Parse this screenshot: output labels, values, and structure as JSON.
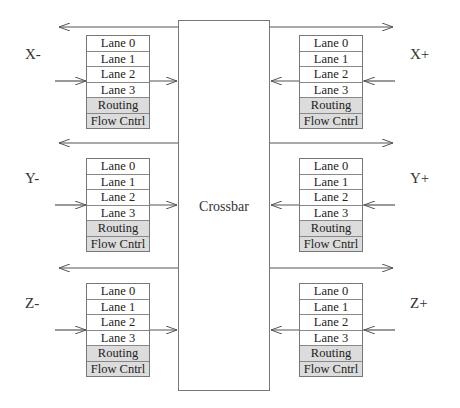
{
  "diagram": {
    "crossbar_label": "Crossbar",
    "colors": {
      "line": "#555555",
      "box_border": "#777777",
      "shaded_row": "#dcdcdc",
      "background": "#ffffff"
    },
    "ports": [
      {
        "id": "x-minus",
        "label": "X-",
        "side": "left",
        "rows": [
          "Lane 0",
          "Lane 1",
          "Lane 2",
          "Lane 3",
          "Routing",
          "Flow Cntrl"
        ]
      },
      {
        "id": "y-minus",
        "label": "Y-",
        "side": "left",
        "rows": [
          "Lane 0",
          "Lane 1",
          "Lane 2",
          "Lane 3",
          "Routing",
          "Flow Cntrl"
        ]
      },
      {
        "id": "z-minus",
        "label": "Z-",
        "side": "left",
        "rows": [
          "Lane 0",
          "Lane 1",
          "Lane 2",
          "Lane 3",
          "Routing",
          "Flow Cntrl"
        ]
      },
      {
        "id": "x-plus",
        "label": "X+",
        "side": "right",
        "rows": [
          "Lane 0",
          "Lane 1",
          "Lane 2",
          "Lane 3",
          "Routing",
          "Flow Cntrl"
        ]
      },
      {
        "id": "y-plus",
        "label": "Y+",
        "side": "right",
        "rows": [
          "Lane 0",
          "Lane 1",
          "Lane 2",
          "Lane 3",
          "Routing",
          "Flow Cntrl"
        ]
      },
      {
        "id": "z-plus",
        "label": "Z+",
        "side": "right",
        "rows": [
          "Lane 0",
          "Lane 1",
          "Lane 2",
          "Lane 3",
          "Routing",
          "Flow Cntrl"
        ]
      }
    ],
    "shaded_rows": [
      "Routing",
      "Flow Cntrl"
    ]
  }
}
